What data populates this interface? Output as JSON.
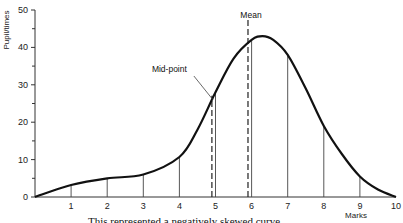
{
  "chart_data": {
    "type": "line",
    "title": "",
    "xlabel": "Marks",
    "ylabel": "Pupil/times",
    "xlim": [
      0,
      10
    ],
    "ylim": [
      0,
      50
    ],
    "x_ticks": [
      1,
      2,
      3,
      4,
      5,
      6,
      7,
      8,
      9,
      10
    ],
    "y_ticks": [
      0,
      10,
      20,
      30,
      40,
      50
    ],
    "grid": false,
    "series": [
      {
        "name": "distribution",
        "x": [
          0,
          1,
          2,
          3,
          4,
          4.5,
          5,
          5.5,
          6,
          6.3,
          6.6,
          7,
          7.5,
          8,
          8.5,
          9,
          9.5,
          10
        ],
        "y": [
          0,
          3.2,
          5,
          6,
          10.7,
          18,
          28,
          37,
          42,
          43,
          42,
          38,
          29,
          19,
          11.5,
          5.5,
          2,
          0
        ]
      }
    ],
    "verticals": [
      {
        "x": 1,
        "style": "solid"
      },
      {
        "x": 2,
        "style": "solid"
      },
      {
        "x": 3,
        "style": "solid"
      },
      {
        "x": 4,
        "style": "solid"
      },
      {
        "x": 4.9,
        "style": "dashed"
      },
      {
        "x": 5,
        "style": "solid"
      },
      {
        "x": 5.9,
        "style": "dashed"
      },
      {
        "x": 6,
        "style": "solid"
      },
      {
        "x": 7,
        "style": "solid"
      },
      {
        "x": 8,
        "style": "solid"
      },
      {
        "x": 9,
        "style": "solid"
      }
    ],
    "annotations": [
      {
        "text": "Mid-point",
        "x": 4.9
      },
      {
        "text": "Mean",
        "x": 5.9
      }
    ],
    "caption": "This represented a negatively skewed curve"
  }
}
